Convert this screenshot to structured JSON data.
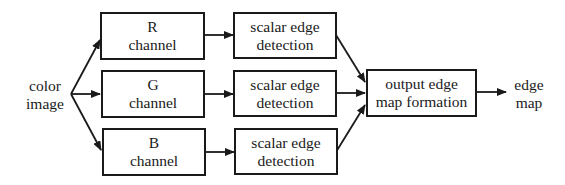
{
  "diagram": {
    "input": {
      "lines": [
        "color",
        "image"
      ]
    },
    "channels": [
      {
        "id": "r",
        "lines": [
          "R",
          "channel"
        ]
      },
      {
        "id": "g",
        "lines": [
          "G",
          "channel"
        ]
      },
      {
        "id": "b",
        "lines": [
          "B",
          "channel"
        ]
      }
    ],
    "detectors": [
      {
        "id": "r",
        "lines": [
          "scalar edge",
          "detection"
        ]
      },
      {
        "id": "g",
        "lines": [
          "scalar edge",
          "detection"
        ]
      },
      {
        "id": "b",
        "lines": [
          "scalar edge",
          "detection"
        ]
      }
    ],
    "combiner": {
      "lines": [
        "output edge",
        "map formation"
      ]
    },
    "output": {
      "lines": [
        "edge",
        "map"
      ]
    },
    "colors": {
      "stroke": "#1a1a1a",
      "background": "#ffffff"
    }
  }
}
